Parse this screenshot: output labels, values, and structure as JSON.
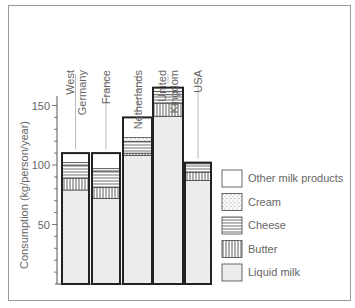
{
  "chart_data": {
    "type": "bar",
    "stacked": true,
    "title": "",
    "xlabel": "",
    "ylabel": "Consumption  (kg/person/year)",
    "ylim": [
      0,
      170
    ],
    "yticks": [
      50,
      100,
      150
    ],
    "minor_tick_step": 10,
    "grid": false,
    "legend_position": "right",
    "categories": [
      "West Germany",
      "France",
      "Netherlands",
      "United Kingdom",
      "USA"
    ],
    "category_label_lines": [
      [
        "West",
        "Germany"
      ],
      [
        "France"
      ],
      [
        "Netherlands"
      ],
      [
        "United",
        "Kingdom"
      ],
      [
        "USA"
      ]
    ],
    "series": [
      {
        "name": "Liquid milk",
        "pattern": "dotted-light",
        "values": [
          79,
          72,
          108,
          141,
          87
        ]
      },
      {
        "name": "Butter",
        "pattern": "vertical-lines",
        "values": [
          10,
          9,
          2,
          11,
          7
        ]
      },
      {
        "name": "Cheese",
        "pattern": "horizontal-lines",
        "values": [
          11,
          14,
          10,
          7,
          7
        ]
      },
      {
        "name": "Cream",
        "pattern": "stipple",
        "values": [
          2,
          2,
          3,
          3,
          0
        ]
      },
      {
        "name": "Other milk products",
        "pattern": "blank",
        "values": [
          8,
          13,
          17,
          3,
          1
        ]
      }
    ],
    "totals": [
      110,
      110,
      140,
      165,
      102
    ],
    "legend_order": [
      "Other milk products",
      "Cream",
      "Cheese",
      "Butter",
      "Liquid milk"
    ]
  },
  "colors": {
    "bar_outline": "#2a2a2a",
    "liquid_fill": "#ececec",
    "text": "#666666",
    "frame": "#9a9a9a"
  }
}
